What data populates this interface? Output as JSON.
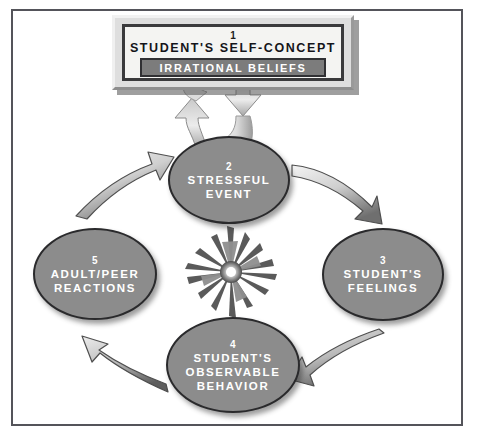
{
  "diagram": {
    "frame_color": "#54545a",
    "background": "#ffffff",
    "node_fill": "#8c8c8c",
    "node_stroke": "#2a2a2c",
    "banner_fill": "#7c7c7c",
    "box_fill": "#f4f4f2"
  },
  "concept_box": {
    "number": "1",
    "title": "STUDENT'S SELF-CONCEPT",
    "banner": "IRRATIONAL BELIEFS"
  },
  "nodes": [
    {
      "id": "node-2",
      "number": "2",
      "lines": [
        "STRESSFUL",
        "EVENT"
      ]
    },
    {
      "id": "node-3",
      "number": "3",
      "lines": [
        "STUDENT'S",
        "FEELINGS"
      ]
    },
    {
      "id": "node-4",
      "number": "4",
      "lines": [
        "STUDENT'S",
        "OBSERVABLE",
        "BEHAVIOR"
      ]
    },
    {
      "id": "node-5",
      "number": "5",
      "lines": [
        "ADULT/PEER",
        "REACTIONS"
      ]
    }
  ],
  "connectors": [
    {
      "name": "arrow-box-to-stressful-event-up",
      "from": "concept-box",
      "to": "node-2",
      "style": "ribbon-block"
    },
    {
      "name": "arrow-stressful-event-to-box-down",
      "from": "node-2",
      "to": "concept-box",
      "style": "ribbon-block"
    },
    {
      "name": "arrow-stressful-event-to-feelings",
      "from": "node-2",
      "to": "node-3",
      "style": "curved-taper"
    },
    {
      "name": "arrow-feelings-to-behavior",
      "from": "node-3",
      "to": "node-4",
      "style": "curved-taper"
    },
    {
      "name": "arrow-behavior-to-reactions",
      "from": "node-4",
      "to": "node-5",
      "style": "curved-taper"
    },
    {
      "name": "arrow-reactions-to-stressful-event",
      "from": "node-5",
      "to": "node-2",
      "style": "curved-taper"
    }
  ],
  "starburst": {
    "name": "central-starburst",
    "center_x": 231,
    "center_y": 272,
    "spike_count": 14
  }
}
